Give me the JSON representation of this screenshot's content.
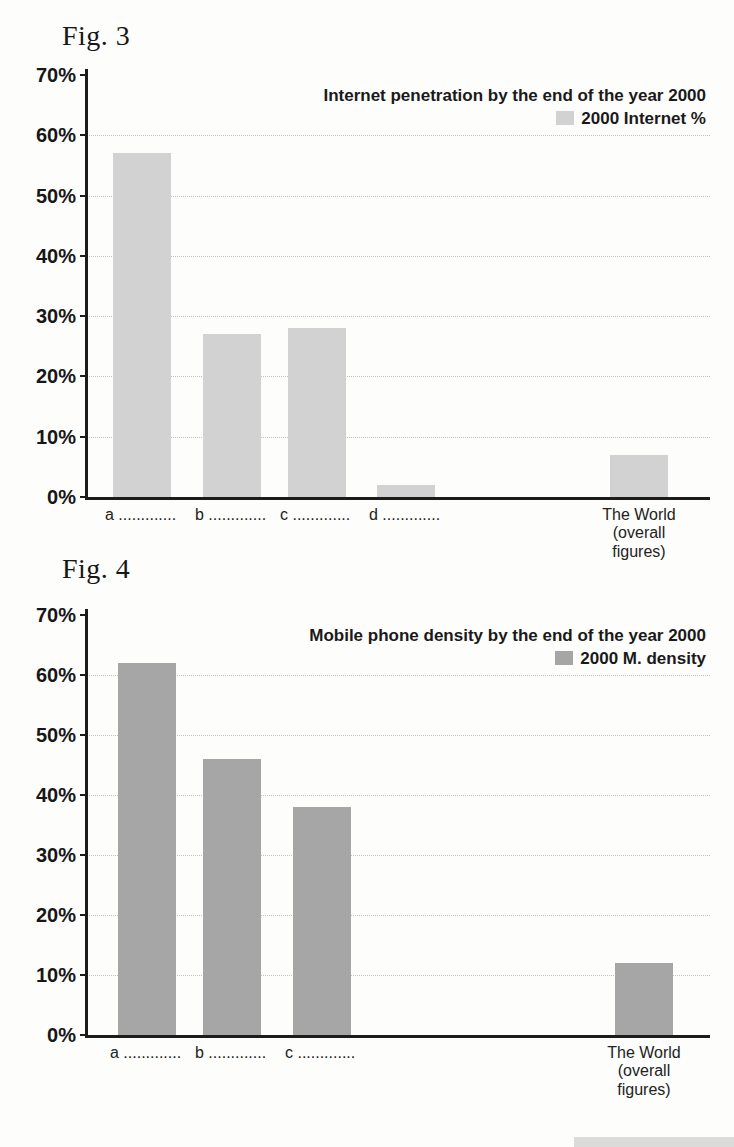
{
  "figures": [
    {
      "heading": "Fig. 3"
    },
    {
      "heading": "Fig. 4"
    }
  ],
  "chart_data": [
    {
      "type": "bar",
      "figure_label": "Fig. 3",
      "title": "Internet penetration by the end of the year 2000",
      "legend": "2000 Internet %",
      "legend_position": "top-right",
      "categories": [
        "a .............",
        "b .............",
        "c .............",
        "d .............",
        "The World\n(overall\nfigures)"
      ],
      "values": [
        57,
        27,
        28,
        2,
        7
      ],
      "xlabel": "",
      "ylabel": "",
      "ylim": [
        0,
        70
      ],
      "ytick_step": 10,
      "ytick_suffix": "%",
      "grid": true,
      "bar_color": "#d2d2d2"
    },
    {
      "type": "bar",
      "figure_label": "Fig. 4",
      "title": "Mobile phone density by the end of the year 2000",
      "legend": "2000 M. density",
      "legend_position": "top-right",
      "categories": [
        "a .............",
        "b .............",
        "c .............",
        "The World\n(overall\nfigures)"
      ],
      "values": [
        62,
        46,
        38,
        12
      ],
      "xlabel": "",
      "ylabel": "",
      "ylim": [
        0,
        70
      ],
      "ytick_step": 10,
      "ytick_suffix": "%",
      "grid": true,
      "bar_color": "#a6a6a6"
    }
  ]
}
